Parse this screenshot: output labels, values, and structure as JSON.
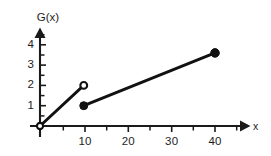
{
  "chart_data": {
    "type": "line",
    "title": "",
    "subtitle": "",
    "xlabel": "x",
    "ylabel": "G(x)",
    "xlim": [
      0,
      46
    ],
    "ylim": [
      0,
      4.6
    ],
    "grid": false,
    "legend": null,
    "x_ticks": [
      10,
      20,
      30,
      40
    ],
    "x_tick_labels": [
      "10",
      "20",
      "30",
      "40"
    ],
    "x_minor_tick_step": 5,
    "y_ticks": [
      1,
      2,
      3,
      4
    ],
    "y_tick_labels": [
      "1",
      "2",
      "3",
      "4"
    ],
    "y_minor_tick_step": 0.5,
    "series": [
      {
        "name": "segment-1",
        "x": [
          0,
          10
        ],
        "values": [
          0,
          2
        ],
        "left_endpoint": "open",
        "right_endpoint": "open"
      },
      {
        "name": "segment-2",
        "x": [
          10,
          40
        ],
        "values": [
          1,
          3.6
        ],
        "left_endpoint": "closed",
        "right_endpoint": "closed"
      }
    ],
    "points": [
      {
        "name": "origin-open-point",
        "x": 0,
        "y": 0,
        "marker": "open-circle"
      },
      {
        "name": "discontinuity-upper-open-point",
        "x": 10,
        "y": 2,
        "marker": "open-circle"
      },
      {
        "name": "discontinuity-lower-closed-point",
        "x": 10,
        "y": 1,
        "marker": "closed-circle"
      },
      {
        "name": "right-closed-point",
        "x": 40,
        "y": 3.6,
        "marker": "closed-circle"
      }
    ],
    "colors": {
      "line": "#111111",
      "axis": "#1a1a1a",
      "background": "#ffffff",
      "text": "#1d1d1d"
    }
  },
  "axes": {
    "y_axis_name": "G(x)",
    "x_axis_name": "x"
  },
  "labels": {
    "y": [
      {
        "text": "4"
      },
      {
        "text": "3"
      },
      {
        "text": "2"
      },
      {
        "text": "1"
      }
    ],
    "x": [
      {
        "text": "10"
      },
      {
        "text": "20"
      },
      {
        "text": "30"
      },
      {
        "text": "40"
      }
    ]
  }
}
